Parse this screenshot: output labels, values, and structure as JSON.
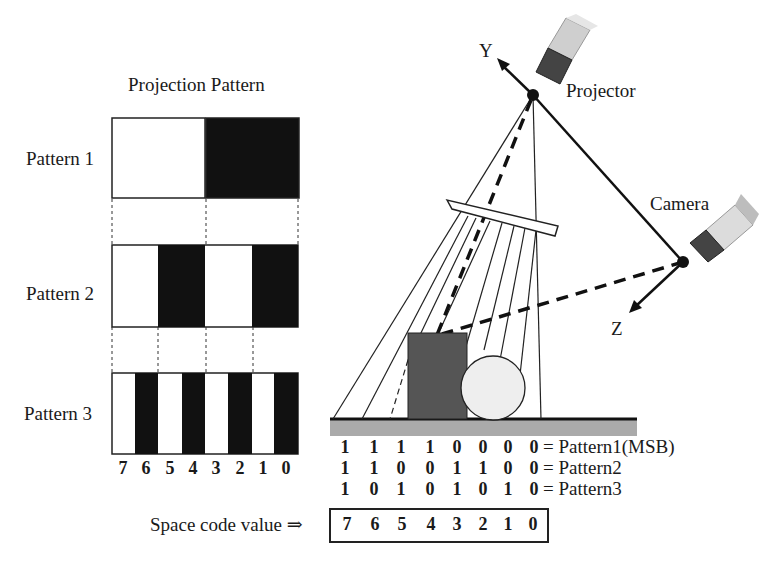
{
  "left_panel": {
    "title": "Projection Pattern",
    "patterns": [
      {
        "label": "Pattern 1",
        "stripes": [
          0,
          0,
          0,
          0,
          1,
          1,
          1,
          1
        ]
      },
      {
        "label": "Pattern 2",
        "stripes": [
          0,
          0,
          1,
          1,
          0,
          0,
          1,
          1
        ]
      },
      {
        "label": "Pattern 3",
        "stripes": [
          0,
          1,
          0,
          1,
          0,
          1,
          0,
          1
        ]
      }
    ],
    "column_indices": [
      "7",
      "6",
      "5",
      "4",
      "3",
      "2",
      "1",
      "0"
    ]
  },
  "scene": {
    "axis_y_label": "Y",
    "axis_z_label": "Z",
    "projector_label": "Projector",
    "camera_label": "Camera"
  },
  "code_table": {
    "rows": [
      {
        "bits": [
          "1",
          "1",
          "1",
          "1",
          "0",
          "0",
          "0",
          "0"
        ],
        "label": "= Pattern1(MSB)"
      },
      {
        "bits": [
          "1",
          "1",
          "0",
          "0",
          "1",
          "1",
          "0",
          "0"
        ],
        "label": "= Pattern2"
      },
      {
        "bits": [
          "1",
          "0",
          "1",
          "0",
          "1",
          "0",
          "1",
          "0"
        ],
        "label": "= Pattern3"
      }
    ],
    "space_code_label": "Space code value ⇒",
    "space_code_values": [
      "7",
      "6",
      "5",
      "4",
      "3",
      "2",
      "1",
      "0"
    ]
  },
  "colors": {
    "black_stripe": "#111111",
    "object_box": "#555555",
    "sphere": "#eeeeee",
    "ground": "#aaaaaa"
  }
}
